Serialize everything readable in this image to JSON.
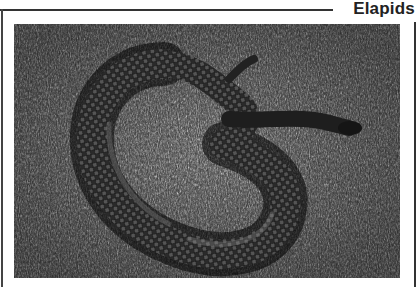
{
  "page": {
    "section_title": "Elapids"
  },
  "photo": {
    "subject": "snake coiled on grass",
    "style": "black-and-white photograph",
    "alt": "Dark elapid snake coiled in grass"
  }
}
